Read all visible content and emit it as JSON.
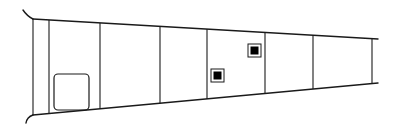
{
  "diagram": {
    "type": "tapered-panel-line-drawing",
    "stroke_color": "#1a1a1a",
    "background": "#ffffff",
    "outline": {
      "top_edge": [
        [
          33,
          19
        ],
        [
          378,
          39
        ]
      ],
      "bottom_edge": [
        [
          33,
          115
        ],
        [
          378,
          83
        ]
      ],
      "root_flare_top": [
        [
          23,
          10
        ],
        [
          33,
          19
        ]
      ],
      "root_flare_bottom": [
        [
          33,
          115
        ],
        [
          26,
          123
        ]
      ]
    },
    "section_lines_x": [
      33,
      49,
      100,
      160,
      207,
      265,
      313,
      372
    ],
    "features": [
      {
        "name": "access-panel",
        "shape": "rounded-rect",
        "x": 54,
        "y": 74,
        "w": 35,
        "h": 36,
        "rx": 4
      },
      {
        "name": "inspection-port-1",
        "shape": "filled-square",
        "x": 211,
        "y": 69,
        "w": 13,
        "h": 13
      },
      {
        "name": "inspection-port-2",
        "shape": "filled-square",
        "x": 248,
        "y": 44,
        "w": 13,
        "h": 13
      }
    ]
  }
}
